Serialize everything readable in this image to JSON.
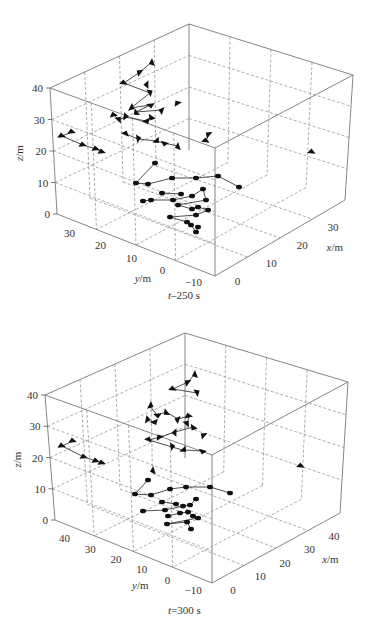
{
  "chart_data": [
    {
      "type": "scatter",
      "subtype": "3d-scatter-with-connecting-lines",
      "title": "t=250 s",
      "caption": "t–250 s",
      "xlabel": "x/m",
      "ylabel": "y/m",
      "zlabel": "z/m",
      "xticks": [
        "0",
        "10",
        "20",
        "30"
      ],
      "yticks": [
        "30",
        "20",
        "10",
        "0",
        "-10"
      ],
      "zticks": [
        "0",
        "10",
        "20",
        "30",
        "40"
      ],
      "xlim": [
        0,
        35
      ],
      "ylim": [
        -15,
        35
      ],
      "zlim": [
        0,
        40
      ],
      "grid": true,
      "frame": {
        "front_bottom": [
          215,
          276
        ],
        "left_bottom": [
          57,
          214
        ],
        "left_top": [
          50,
          88
        ],
        "back_top": [
          189,
          24
        ],
        "right_top": [
          353,
          75
        ],
        "right_bottom": [
          345,
          200
        ],
        "front_top": [
          215,
          148
        ]
      },
      "markers": {
        "upper_group": [
          [
            152,
            62
          ],
          [
            140,
            72
          ],
          [
            124,
            83
          ],
          [
            150,
            93
          ],
          [
            131,
            108
          ],
          [
            150,
            105
          ],
          [
            136,
            112
          ],
          [
            162,
            110
          ],
          [
            114,
            115
          ],
          [
            119,
            120
          ],
          [
            125,
            117
          ],
          [
            146,
            121
          ],
          [
            151,
            117
          ],
          [
            147,
            84
          ],
          [
            178,
            103
          ],
          [
            126,
            134
          ],
          [
            138,
            139
          ],
          [
            156,
            141
          ],
          [
            164,
            143
          ],
          [
            178,
            146
          ],
          [
            209,
            134
          ],
          [
            206,
            141
          ]
        ],
        "left_group": [
          [
            72,
            132
          ],
          [
            62,
            136
          ],
          [
            83,
            145
          ],
          [
            96,
            149
          ],
          [
            102,
            152
          ]
        ],
        "right_outlier": [
          [
            312,
            152
          ]
        ],
        "lower_group": [
          [
            155,
            163
          ],
          [
            136,
            183
          ],
          [
            148,
            184
          ],
          [
            172,
            178
          ],
          [
            196,
            178
          ],
          [
            218,
            176
          ],
          [
            239,
            187
          ],
          [
            162,
            193
          ],
          [
            181,
            194
          ],
          [
            143,
            201
          ],
          [
            151,
            200
          ],
          [
            173,
            200
          ],
          [
            192,
            196
          ],
          [
            203,
            189
          ],
          [
            206,
            200
          ],
          [
            178,
            205
          ],
          [
            192,
            209
          ],
          [
            198,
            207
          ],
          [
            208,
            210
          ],
          [
            196,
            215
          ],
          [
            170,
            217
          ],
          [
            187,
            222
          ],
          [
            191,
            225
          ],
          [
            196,
            232
          ],
          [
            198,
            227
          ]
        ]
      }
    },
    {
      "type": "scatter",
      "subtype": "3d-scatter-with-connecting-lines",
      "title": "t=300 s",
      "caption": "t=300 s",
      "xlabel": "x/m",
      "ylabel": "y/m",
      "zlabel": "z/m",
      "xticks": [
        "0",
        "10",
        "20",
        "30",
        "40"
      ],
      "yticks": [
        "40",
        "30",
        "20",
        "10",
        "0",
        "-10"
      ],
      "zticks": [
        "0",
        "10",
        "20",
        "30",
        "40"
      ],
      "xlim": [
        0,
        42
      ],
      "ylim": [
        -15,
        42
      ],
      "zlim": [
        0,
        40
      ],
      "grid": true,
      "frame": {
        "front_bottom": [
          212,
          583
        ],
        "left_bottom": [
          55,
          520
        ],
        "left_top": [
          45,
          395
        ],
        "back_top": [
          185,
          333
        ],
        "right_top": [
          348,
          382
        ],
        "right_bottom": [
          340,
          513
        ],
        "front_top": [
          212,
          455
        ]
      },
      "markers": {
        "upper_group": [
          [
            195,
            374
          ],
          [
            188,
            382
          ],
          [
            173,
            389
          ],
          [
            197,
            393
          ],
          [
            150,
            406
          ],
          [
            157,
            415
          ],
          [
            166,
            412
          ],
          [
            178,
            419
          ],
          [
            189,
            416
          ],
          [
            187,
            424
          ],
          [
            147,
            420
          ],
          [
            154,
            422
          ],
          [
            193,
            427
          ],
          [
            175,
            432
          ],
          [
            160,
            437
          ],
          [
            149,
            440
          ],
          [
            172,
            447
          ],
          [
            183,
            450
          ],
          [
            202,
            451
          ],
          [
            153,
            470
          ],
          [
            204,
            435
          ]
        ],
        "left_group": [
          [
            73,
            441
          ],
          [
            62,
            446
          ],
          [
            84,
            457
          ],
          [
            96,
            461
          ],
          [
            102,
            463
          ]
        ],
        "right_outlier": [
          [
            301,
            466
          ]
        ],
        "lower_group": [
          [
            148,
            480
          ],
          [
            135,
            494
          ],
          [
            151,
            495
          ],
          [
            170,
            489
          ],
          [
            186,
            487
          ],
          [
            210,
            487
          ],
          [
            230,
            493
          ],
          [
            162,
            502
          ],
          [
            176,
            504
          ],
          [
            143,
            511
          ],
          [
            165,
            510
          ],
          [
            183,
            506
          ],
          [
            190,
            505
          ],
          [
            196,
            499
          ],
          [
            168,
            516
          ],
          [
            180,
            513
          ],
          [
            188,
            512
          ],
          [
            193,
            516
          ],
          [
            198,
            518
          ],
          [
            167,
            524
          ],
          [
            187,
            522
          ],
          [
            191,
            529
          ]
        ]
      }
    }
  ],
  "captions": {
    "panel1": {
      "var": "t",
      "rest": "–250 s"
    },
    "panel2": {
      "var": "t",
      "rest": "=300 s"
    }
  },
  "axis_labels": {
    "z": {
      "var": "z",
      "unit": "/m"
    },
    "y": {
      "var": "y",
      "unit": "/m"
    },
    "x": {
      "var": "x",
      "unit": "/m"
    }
  }
}
